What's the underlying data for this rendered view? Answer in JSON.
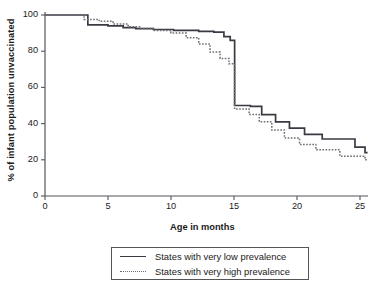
{
  "chart_data": {
    "type": "line",
    "title": "",
    "xlabel": "Age in months",
    "ylabel": "% of infant population unvaccinated",
    "xlim": [
      0,
      25.6
    ],
    "ylim": [
      0,
      104
    ],
    "xticks": [
      0,
      5,
      10,
      15,
      20,
      25
    ],
    "yticks": [
      0,
      20,
      40,
      60,
      80,
      100
    ],
    "grid": false,
    "legend_position": "below-plot",
    "step_style": "post",
    "series": [
      {
        "name": "States with very low prevalence",
        "style": "solid",
        "color": "#3a3a42",
        "x": [
          0.0,
          2.6,
          3.4,
          5.0,
          6.2,
          7.2,
          8.6,
          10.2,
          12.2,
          13.4,
          14.2,
          14.7,
          15.0,
          15.05,
          16.3,
          17.2,
          18.3,
          19.4,
          20.6,
          22.0,
          24.6,
          25.4
        ],
        "y": [
          100,
          100,
          94.5,
          94.0,
          93.0,
          92.5,
          92.0,
          91.5,
          91.0,
          90.5,
          88.0,
          86.0,
          86.0,
          50.0,
          49.5,
          45.0,
          41.0,
          37.5,
          34.0,
          31.5,
          27.0,
          24.0
        ]
      },
      {
        "name": "States with very high prevalence",
        "style": "dotted",
        "color": "#6c6c74",
        "x": [
          0.0,
          2.2,
          3.1,
          4.3,
          5.4,
          6.6,
          7.6,
          8.6,
          10.0,
          11.2,
          12.2,
          13.1,
          13.9,
          14.6,
          15.0,
          15.05,
          16.2,
          17.0,
          18.0,
          19.0,
          20.2,
          21.5,
          23.4,
          25.4
        ],
        "y": [
          100,
          100,
          97.5,
          96.5,
          95.0,
          93.5,
          92.5,
          91.5,
          90.0,
          87.5,
          84.0,
          79.5,
          76.0,
          73.0,
          73.0,
          48.0,
          45.0,
          41.0,
          36.5,
          32.0,
          28.5,
          25.5,
          22.0,
          20.0
        ]
      }
    ]
  }
}
